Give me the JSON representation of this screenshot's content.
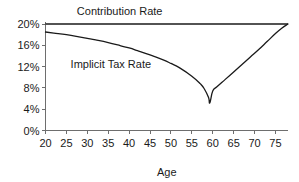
{
  "chart_data": {
    "type": "line",
    "title": "",
    "xlabel": "Age",
    "ylabel": "",
    "xlim": [
      20,
      78
    ],
    "ylim": [
      0,
      20
    ],
    "grid": false,
    "legend_position": "inline-annotation",
    "x_tick_labels": [
      "20",
      "25",
      "30",
      "35",
      "40",
      "45",
      "50",
      "55",
      "60",
      "65",
      "70",
      "75"
    ],
    "x_ticks": [
      20,
      25,
      30,
      35,
      40,
      45,
      50,
      55,
      60,
      65,
      70,
      75
    ],
    "y_tick_labels": [
      "0%",
      "4%",
      "8%",
      "12%",
      "16%",
      "20%"
    ],
    "y_ticks": [
      0,
      4,
      8,
      12,
      16,
      20
    ],
    "annotations": [
      {
        "text": "Contribution Rate",
        "x": 27.5,
        "y": 21.6
      },
      {
        "text": "Implicit Tax Rate",
        "x": 26.0,
        "y": 11.8
      }
    ],
    "series": [
      {
        "name": "Contribution Rate",
        "x": [
          20,
          78
        ],
        "values": [
          20.0,
          20.0
        ]
      },
      {
        "name": "Implicit Tax Rate",
        "x": [
          20,
          22,
          25,
          28,
          30,
          32,
          35,
          38,
          40,
          42,
          45,
          48,
          50,
          52,
          55,
          57,
          58,
          59,
          59.3,
          60,
          61,
          63,
          65,
          67,
          69,
          71,
          73,
          75,
          76.5,
          78
        ],
        "values": [
          18.5,
          18.3,
          18.0,
          17.6,
          17.3,
          17.0,
          16.5,
          15.9,
          15.5,
          15.0,
          14.2,
          13.3,
          12.6,
          11.8,
          10.2,
          8.8,
          7.8,
          6.2,
          5.2,
          7.4,
          8.2,
          9.6,
          11.0,
          12.4,
          13.8,
          15.2,
          16.7,
          18.2,
          19.2,
          20.0
        ]
      }
    ]
  }
}
